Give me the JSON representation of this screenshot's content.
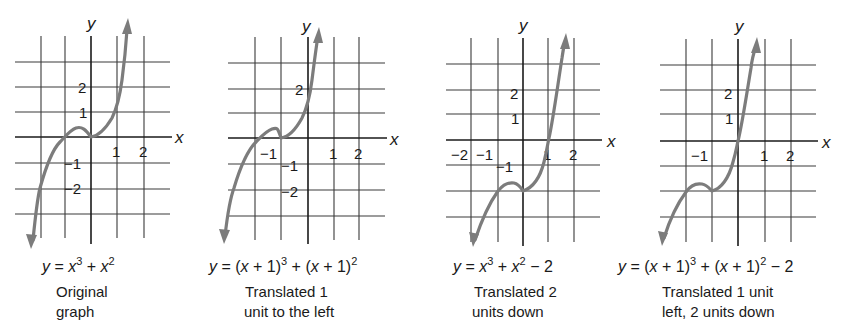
{
  "figure": {
    "panels": [
      {
        "id": "original",
        "equation": {
          "lhs": "y",
          "parts": [
            "x",
            "3",
            " + ",
            "x",
            "2",
            ""
          ]
        },
        "equation_text": "y = x³ + x²",
        "caption": [
          "Original",
          "graph"
        ],
        "axis_labels": {
          "x": "x",
          "y": "y"
        },
        "x_ticks": [
          "1",
          "2"
        ],
        "y_ticks": [
          "2",
          "1",
          "−1",
          "−2"
        ]
      },
      {
        "id": "left-1",
        "equation_text": "y = (x + 1)³ + (x + 1)²",
        "caption": [
          "Translated 1",
          "unit to the left"
        ],
        "axis_labels": {
          "x": "x",
          "y": "y"
        },
        "x_ticks": [
          "−1",
          "1",
          "2"
        ],
        "y_ticks": [
          "2",
          "−1",
          "−2"
        ]
      },
      {
        "id": "down-2",
        "equation_text": "y = x³ + x² − 2",
        "caption": [
          "Translated 2",
          "units down"
        ],
        "axis_labels": {
          "x": "x",
          "y": "y"
        },
        "x_ticks": [
          "−2",
          "−1",
          "1",
          "2"
        ],
        "y_ticks": [
          "2",
          "1",
          "−1"
        ]
      },
      {
        "id": "left-1-down-2",
        "equation_text": "y = (x + 1)³ + (x + 1)² − 2",
        "caption": [
          "Translated 1 unit",
          "left, 2 units down"
        ],
        "axis_labels": {
          "x": "x",
          "y": "y"
        },
        "x_ticks": [
          "−1",
          "1",
          "2"
        ],
        "y_ticks": [
          "2",
          "1"
        ]
      }
    ]
  },
  "labels": {
    "p1": {
      "y": "y",
      "x": "x",
      "t_x1": "1",
      "t_x2": "2",
      "t_y2": "2",
      "t_y1": "1",
      "t_ym1": "−1",
      "t_ym2": "−2",
      "eq_y": "y",
      "eq_eq": " = ",
      "eq_x1": "x",
      "eq_e1": "3",
      "eq_plus": " + ",
      "eq_x2": "x",
      "eq_e2": "2",
      "cap1": "Original",
      "cap2": "graph"
    },
    "p2": {
      "y": "y",
      "x": "x",
      "t_xm1": "−1",
      "t_x1": "1",
      "t_x2": "2",
      "t_y2": "2",
      "t_ym1": "−1",
      "t_ym2": "−2",
      "eq_y": "y",
      "eq_a": " = (",
      "eq_x1": "x",
      "eq_b": " + 1)",
      "eq_e1": "3",
      "eq_c": " + (",
      "eq_x2": "x",
      "eq_d": " + 1)",
      "eq_e2": "2",
      "cap1": "Translated 1",
      "cap2": "unit to the left"
    },
    "p3": {
      "y": "y",
      "x": "x",
      "t_xm2": "−2",
      "t_xm1": "−1",
      "t_x1": "1",
      "t_x2": "2",
      "t_y2": "2",
      "t_y1": "1",
      "t_ym1": "−1",
      "eq_y": "y",
      "eq_eq": " = ",
      "eq_x1": "x",
      "eq_e1": "3",
      "eq_plus": " + ",
      "eq_x2": "x",
      "eq_e2": "2",
      "eq_tail": " − 2",
      "cap1": "Translated 2",
      "cap2": "units down"
    },
    "p4": {
      "y": "y",
      "x": "x",
      "t_xm1": "−1",
      "t_x1": "1",
      "t_x2": "2",
      "t_y2": "2",
      "t_y1": "1",
      "eq_y": "y",
      "eq_a": " = (",
      "eq_x1": "x",
      "eq_b": " + 1)",
      "eq_e1": "3",
      "eq_c": " + (",
      "eq_x2": "x",
      "eq_d": " + 1)",
      "eq_e2": "2",
      "eq_tail": " − 2",
      "cap1": "Translated 1 unit",
      "cap2": "left, 2 units down"
    }
  },
  "colors": {
    "curve": "#7c7c7c",
    "grid": "#3a3a3a",
    "text": "#1a1a1a",
    "background": "#ffffff"
  }
}
